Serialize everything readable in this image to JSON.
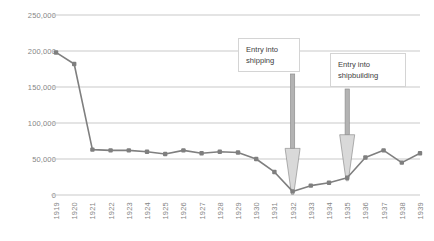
{
  "chart_data": {
    "type": "line",
    "title": "",
    "xlabel": "",
    "ylabel": "",
    "ylim": [
      0,
      250000
    ],
    "ytick_labels": [
      "0",
      "50,000",
      "100,000",
      "150,000",
      "200,000",
      "250,000"
    ],
    "ytick_values": [
      0,
      50000,
      100000,
      150000,
      200000,
      250000
    ],
    "grid": true,
    "legend": "none",
    "marker": "square",
    "line_color": "#7f7f7f",
    "grid_color": "#c9c9c9",
    "categories": [
      "1919",
      "1920",
      "1921",
      "1922",
      "1923",
      "1924",
      "1925",
      "1926",
      "1927",
      "1928",
      "1929",
      "1930",
      "1931",
      "1932",
      "1933",
      "1934",
      "1935",
      "1936",
      "1937",
      "1938",
      "1939"
    ],
    "values": [
      198000,
      182000,
      63000,
      62000,
      62000,
      60000,
      57000,
      62000,
      58000,
      60000,
      59000,
      50000,
      32000,
      5000,
      13000,
      17000,
      24000,
      52000,
      62000,
      45000,
      58000
    ],
    "annotations": [
      {
        "name": "entry-into-shipping",
        "text_line1": "Entry into",
        "text_line2": "shipping",
        "points_to_year": "1932",
        "points_to_value": 5000
      },
      {
        "name": "entry-into-shipbuilding",
        "text_line1": "Entry into",
        "text_line2": "shipbuilding",
        "points_to_year": "1935",
        "points_to_value": 24000
      }
    ]
  }
}
